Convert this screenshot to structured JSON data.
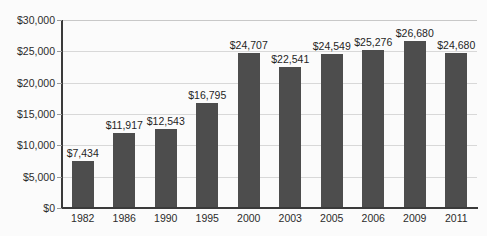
{
  "chart_data": {
    "type": "bar",
    "title": "",
    "subtitle": "",
    "xlabel": "",
    "ylabel": "",
    "categories": [
      "1982",
      "1986",
      "1990",
      "1995",
      "2000",
      "2003",
      "2005",
      "2006",
      "2009",
      "2011"
    ],
    "values": [
      7434,
      11917,
      12543,
      16795,
      24707,
      22541,
      24549,
      25276,
      26680,
      24680
    ],
    "value_labels": [
      "$7,434",
      "$11,917",
      "$12,543",
      "$16,795",
      "$24,707",
      "$22,541",
      "$24,549",
      "$25,276",
      "$26,680",
      "$24,680"
    ],
    "ylim": [
      0,
      30000
    ],
    "ytick_values": [
      0,
      5000,
      10000,
      15000,
      20000,
      25000,
      30000
    ],
    "ytick_labels": [
      "$0",
      "$5,000",
      "$10,000",
      "$15,000",
      "$20,000",
      "$25,000",
      "$30,000"
    ],
    "grid": true,
    "legend": "none",
    "series_color": "#4d4d4d",
    "gridline_color": "#d8d8d8",
    "axis_color": "#3a3a3a",
    "background_color": "#fbfbfb"
  }
}
